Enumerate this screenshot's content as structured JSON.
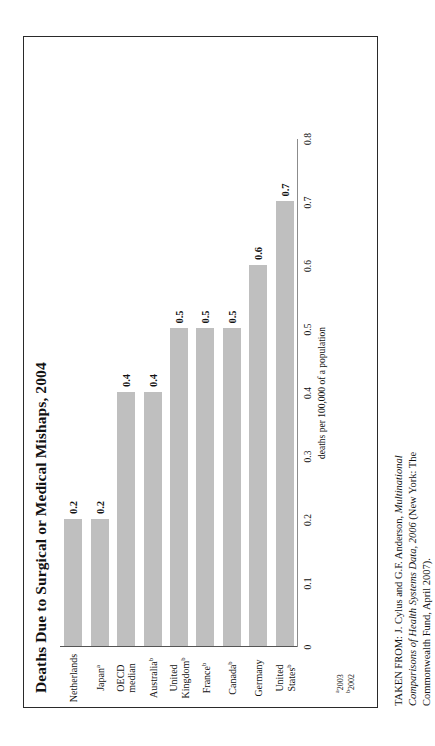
{
  "scan_artifact": "",
  "figure": {
    "title": "Deaths Due to Surgical or Medical Mishaps, 2004",
    "value_axis_title": "deaths per 100,000 of a population",
    "footnotes": [
      {
        "marker": "a",
        "text": "2003"
      },
      {
        "marker": "b",
        "text": "2002"
      }
    ]
  },
  "source": {
    "prefix": "TAKEN FROM: J. Cylus and G.F. Anderson, ",
    "italic": "Multinational Comparisons of Health Systems Data, 2006",
    "suffix": " (New York: The Commonwealth Fund, April 2007)."
  },
  "chart_data": {
    "type": "bar",
    "title": "Deaths Due to Surgical or Medical Mishaps, 2004",
    "xlabel": "",
    "ylabel": "deaths per 100,000 of a population",
    "ylim": [
      0,
      0.8
    ],
    "grid": false,
    "legend": "none",
    "orientation": "vertical",
    "bar_color": "#bfbfbf",
    "tick_labels": [
      "0",
      "0.1",
      "0.2",
      "0.3",
      "0.4",
      "0.5",
      "0.6",
      "0.7",
      "0.8"
    ],
    "tick_values": [
      0,
      0.1,
      0.2,
      0.3,
      0.4,
      0.5,
      0.6,
      0.7,
      0.8
    ],
    "categories": [
      "United States",
      "Germany",
      "Canada",
      "France",
      "United Kingdom",
      "Australia",
      "OECD median",
      "Japan",
      "Netherlands"
    ],
    "category_footnote_markers": [
      "b",
      "",
      "b",
      "b",
      "b",
      "b",
      "",
      "a",
      ""
    ],
    "category_lines": [
      [
        "United",
        "States"
      ],
      [
        "Germany"
      ],
      [
        "Canada"
      ],
      [
        "France"
      ],
      [
        "United",
        "Kingdom"
      ],
      [
        "Australia"
      ],
      [
        "OECD",
        "median"
      ],
      [
        "Japan"
      ],
      [
        "Netherlands"
      ]
    ],
    "values": [
      0.7,
      0.6,
      0.5,
      0.5,
      0.5,
      0.4,
      0.4,
      0.2,
      0.2
    ],
    "data_labels": [
      "0.7",
      "0.6",
      "0.5",
      "0.5",
      "0.5",
      "0.4",
      "0.4",
      "0.2",
      "0.2"
    ]
  }
}
